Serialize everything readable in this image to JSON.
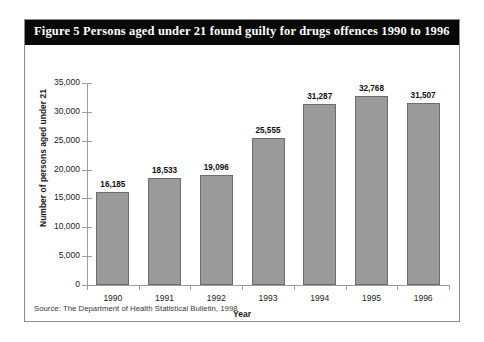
{
  "figure": {
    "title": "Figure 5  Persons aged under 21 found guilty for drugs offences 1990 to 1996",
    "source": "Source: The Department of Health Statistical Bulletin, 1998",
    "title_bar_color": "#080808",
    "title_text_color": "#ffffff",
    "border_color": "#8c8c8c",
    "bar_fill_color": "#9a9a9a",
    "bar_edge_color": "#6d6d6d"
  },
  "chart_data": {
    "type": "bar",
    "title": "Persons aged under 21 found guilty for drugs offences 1990 to 1996",
    "xlabel": "Year",
    "ylabel": "Number of persons aged under 21",
    "categories": [
      "1990",
      "1991",
      "1992",
      "1993",
      "1994",
      "1995",
      "1996"
    ],
    "values": [
      16185,
      18533,
      19096,
      25555,
      31287,
      32768,
      31507
    ],
    "value_labels": [
      "16,185",
      "18,533",
      "19,096",
      "25,555",
      "31,287",
      "32,768",
      "31,507"
    ],
    "ylim": [
      0,
      35000
    ],
    "ytick_values": [
      0,
      5000,
      10000,
      15000,
      20000,
      25000,
      30000,
      35000
    ],
    "ytick_labels": [
      "0",
      "5,000",
      "10,000",
      "15,000",
      "20,000",
      "25,000",
      "30,000",
      "35,000"
    ],
    "grid": false,
    "legend": null
  }
}
